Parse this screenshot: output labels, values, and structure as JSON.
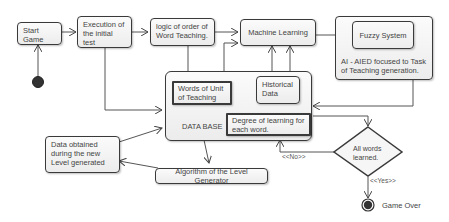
{
  "diagram": {
    "nodes": {
      "start_game": "Start Game",
      "execution_initial_test": "Execution of the initial test",
      "logic_order": "logic of order of Word Teaching.",
      "machine_learning": "Machine Learning",
      "fuzzy_system": "Fuzzy  System",
      "ai_aied": "AI - AIED focused to Task of Teaching generation.",
      "database": "DATA BASE",
      "words_unit": "Words of Unit of Teaching",
      "historical_data": "Historical Data",
      "degree_learning": "Degree of learning for each word.",
      "data_obtained": "Data obtained during the new Level generated",
      "algorithm_level": "Algorithm of the Level Generator",
      "decision": "All words learned.",
      "game_over": "Game Over"
    },
    "edge_labels": {
      "no": "<<No>>",
      "yes": "<<Yes>>"
    }
  }
}
